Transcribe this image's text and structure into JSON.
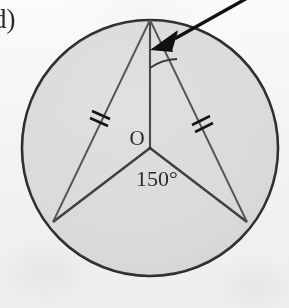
{
  "figure": {
    "item_label": "d)",
    "center_label": "O",
    "central_angle_label": "150°",
    "apex_angle_label": "",
    "colors": {
      "page_background": "#fbfbfa",
      "circle_fill": "#d7d7d7",
      "circle_stroke": "#2a2a2a",
      "radius_stroke": "#4a4a4a",
      "chord_stroke": "#555555",
      "tick_stroke": "#1a1a1a",
      "arrow_fill": "#111111",
      "text_color": "#2b2b2b"
    },
    "geometry": {
      "circle": {
        "cx": 150,
        "cy": 148,
        "r": 128
      },
      "center_point": {
        "x": 150,
        "y": 148
      },
      "apex_point": {
        "x": 150,
        "y": 20
      },
      "bottom_left_point": {
        "x": 53,
        "y": 222
      },
      "bottom_right_point": {
        "x": 247,
        "y": 222
      },
      "central_angle_degrees": 150,
      "tick_marks": [
        {
          "id": "left-chord-ticks",
          "count": 2,
          "x": 101,
          "y": 118
        },
        {
          "id": "right-chord-ticks",
          "count": 2,
          "x": 200,
          "y": 123
        }
      ],
      "apex_arc": {
        "radius": 48,
        "from_deg": 90,
        "to_deg": 56
      },
      "arrow": {
        "tail_x": 255,
        "tail_y": -6,
        "head_x": 160,
        "head_y": 47
      }
    }
  }
}
